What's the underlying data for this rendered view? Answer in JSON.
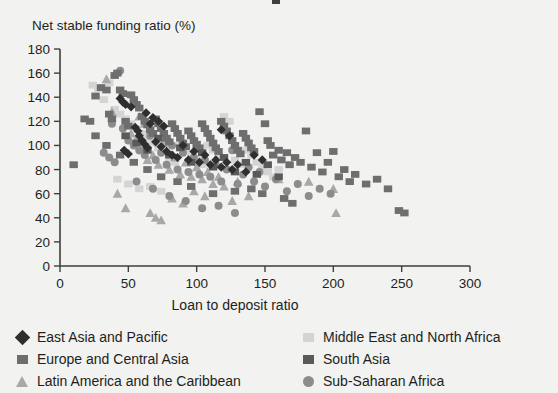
{
  "chart_data": {
    "type": "scatter",
    "title": "",
    "xlabel": "Loan to deposit ratio",
    "ylabel": "Net stable funding ratio (%)",
    "xlim": [
      0,
      300
    ],
    "ylim": [
      0,
      180
    ],
    "xticks": [
      0,
      50,
      100,
      150,
      200,
      250,
      300
    ],
    "yticks": [
      0,
      20,
      40,
      60,
      80,
      100,
      120,
      140,
      160,
      180
    ],
    "grid": false,
    "legend_position": "below-plot-two-columns",
    "series": [
      {
        "name": "East Asia and Pacific",
        "marker": "diamond",
        "color": "#2f2f2f",
        "points": [
          [
            44,
            139
          ],
          [
            46,
            136
          ],
          [
            48,
            134
          ],
          [
            52,
            132
          ],
          [
            55,
            115
          ],
          [
            57,
            112
          ],
          [
            58,
            108
          ],
          [
            60,
            104
          ],
          [
            62,
            101
          ],
          [
            64,
            98
          ],
          [
            47,
            96
          ],
          [
            50,
            93
          ],
          [
            66,
            118
          ],
          [
            70,
            103
          ],
          [
            74,
            99
          ],
          [
            78,
            95
          ],
          [
            82,
            92
          ],
          [
            86,
            90
          ],
          [
            90,
            100
          ],
          [
            94,
            88
          ],
          [
            98,
            95
          ],
          [
            102,
            86
          ],
          [
            106,
            92
          ],
          [
            110,
            84
          ],
          [
            114,
            88
          ],
          [
            118,
            82
          ],
          [
            122,
            86
          ],
          [
            126,
            80
          ],
          [
            130,
            84
          ],
          [
            136,
            78
          ],
          [
            142,
            92
          ],
          [
            148,
            88
          ],
          [
            118,
            113
          ],
          [
            124,
            108
          ],
          [
            63,
            127
          ],
          [
            68,
            123
          ],
          [
            72,
            120
          ],
          [
            76,
            116
          ]
        ]
      },
      {
        "name": "Europe and Central Asia",
        "marker": "square",
        "color": "#6e6e6e",
        "points": [
          [
            10,
            84
          ],
          [
            18,
            122
          ],
          [
            22,
            120
          ],
          [
            26,
            141
          ],
          [
            30,
            148
          ],
          [
            34,
            146
          ],
          [
            36,
            126
          ],
          [
            38,
            122
          ],
          [
            40,
            158
          ],
          [
            42,
            160
          ],
          [
            44,
            146
          ],
          [
            46,
            143
          ],
          [
            48,
            120
          ],
          [
            50,
            116
          ],
          [
            52,
            142
          ],
          [
            54,
            138
          ],
          [
            56,
            134
          ],
          [
            58,
            131
          ],
          [
            60,
            124
          ],
          [
            62,
            120
          ],
          [
            64,
            117
          ],
          [
            66,
            113
          ],
          [
            68,
            110
          ],
          [
            70,
            122
          ],
          [
            72,
            118
          ],
          [
            74,
            114
          ],
          [
            76,
            110
          ],
          [
            78,
            106
          ],
          [
            80,
            103
          ],
          [
            82,
            118
          ],
          [
            84,
            114
          ],
          [
            86,
            110
          ],
          [
            88,
            106
          ],
          [
            90,
            102
          ],
          [
            92,
            99
          ],
          [
            94,
            112
          ],
          [
            96,
            108
          ],
          [
            98,
            104
          ],
          [
            100,
            101
          ],
          [
            102,
            98
          ],
          [
            104,
            118
          ],
          [
            106,
            114
          ],
          [
            108,
            110
          ],
          [
            110,
            106
          ],
          [
            112,
            102
          ],
          [
            114,
            98
          ],
          [
            116,
            95
          ],
          [
            118,
            120
          ],
          [
            120,
            116
          ],
          [
            122,
            112
          ],
          [
            124,
            108
          ],
          [
            126,
            104
          ],
          [
            128,
            100
          ],
          [
            130,
            96
          ],
          [
            132,
            93
          ],
          [
            134,
            110
          ],
          [
            136,
            106
          ],
          [
            138,
            102
          ],
          [
            140,
            98
          ],
          [
            142,
            95
          ],
          [
            146,
            128
          ],
          [
            150,
            118
          ],
          [
            152,
            104
          ],
          [
            154,
            100
          ],
          [
            156,
            92
          ],
          [
            160,
            96
          ],
          [
            162,
            88
          ],
          [
            166,
            94
          ],
          [
            168,
            84
          ],
          [
            172,
            90
          ],
          [
            176,
            86
          ],
          [
            180,
            112
          ],
          [
            184,
            82
          ],
          [
            188,
            94
          ],
          [
            192,
            78
          ],
          [
            196,
            86
          ],
          [
            200,
            95
          ],
          [
            204,
            74
          ],
          [
            208,
            80
          ],
          [
            212,
            70
          ],
          [
            216,
            76
          ],
          [
            224,
            68
          ],
          [
            232,
            72
          ],
          [
            240,
            64
          ],
          [
            248,
            46
          ],
          [
            252,
            44
          ],
          [
            164,
            56
          ],
          [
            170,
            52
          ],
          [
            140,
            64
          ],
          [
            148,
            60
          ],
          [
            128,
            62
          ],
          [
            112,
            60
          ],
          [
            96,
            66
          ],
          [
            86,
            70
          ],
          [
            74,
            74
          ],
          [
            64,
            80
          ],
          [
            54,
            86
          ],
          [
            44,
            92
          ],
          [
            34,
            100
          ],
          [
            26,
            108
          ]
        ]
      },
      {
        "name": "Latin America and the Caribbean",
        "marker": "triangle",
        "color": "#a8a8a8",
        "points": [
          [
            34,
            155
          ],
          [
            38,
            128
          ],
          [
            42,
            60
          ],
          [
            48,
            48
          ],
          [
            52,
            110
          ],
          [
            56,
            106
          ],
          [
            60,
            96
          ],
          [
            64,
            88
          ],
          [
            68,
            92
          ],
          [
            72,
            84
          ],
          [
            76,
            102
          ],
          [
            80,
            80
          ],
          [
            84,
            90
          ],
          [
            88,
            76
          ],
          [
            92,
            86
          ],
          [
            96,
            74
          ],
          [
            100,
            82
          ],
          [
            104,
            72
          ],
          [
            108,
            78
          ],
          [
            112,
            68
          ],
          [
            116,
            74
          ],
          [
            120,
            66
          ],
          [
            66,
            44
          ],
          [
            70,
            40
          ],
          [
            74,
            38
          ],
          [
            82,
            56
          ],
          [
            90,
            52
          ],
          [
            98,
            62
          ],
          [
            130,
            70
          ],
          [
            138,
            58
          ],
          [
            160,
            72
          ],
          [
            182,
            70
          ],
          [
            200,
            64
          ],
          [
            202,
            44
          ],
          [
            126,
            54
          ],
          [
            106,
            58
          ],
          [
            58,
            124
          ],
          [
            62,
            118
          ]
        ]
      },
      {
        "name": "Middle East and North Africa",
        "marker": "square",
        "color": "#d4d4d4",
        "points": [
          [
            24,
            150
          ],
          [
            28,
            147
          ],
          [
            32,
            138
          ],
          [
            36,
            152
          ],
          [
            40,
            130
          ],
          [
            44,
            126
          ],
          [
            48,
            122
          ],
          [
            52,
            118
          ],
          [
            56,
            114
          ],
          [
            60,
            110
          ],
          [
            64,
            106
          ],
          [
            68,
            102
          ],
          [
            72,
            98
          ],
          [
            76,
            94
          ],
          [
            80,
            90
          ],
          [
            84,
            86
          ],
          [
            88,
            100
          ],
          [
            92,
            96
          ],
          [
            96,
            92
          ],
          [
            100,
            88
          ],
          [
            104,
            84
          ],
          [
            108,
            100
          ],
          [
            112,
            96
          ],
          [
            116,
            92
          ],
          [
            120,
            124
          ],
          [
            124,
            120
          ],
          [
            128,
            88
          ],
          [
            132,
            84
          ],
          [
            136,
            96
          ],
          [
            140,
            92
          ],
          [
            144,
            86
          ],
          [
            148,
            82
          ],
          [
            152,
            78
          ],
          [
            156,
            74
          ],
          [
            160,
            80
          ],
          [
            42,
            72
          ],
          [
            50,
            68
          ],
          [
            58,
            64
          ],
          [
            66,
            66
          ],
          [
            74,
            62
          ]
        ]
      },
      {
        "name": "South Asia",
        "marker": "square",
        "color": "#5a5a5a",
        "points": [
          [
            48,
            108
          ],
          [
            56,
            102
          ],
          [
            64,
            96
          ],
          [
            72,
            106
          ],
          [
            80,
            92
          ],
          [
            88,
            98
          ],
          [
            96,
            86
          ],
          [
            104,
            94
          ],
          [
            112,
            82
          ],
          [
            120,
            90
          ],
          [
            128,
            78
          ],
          [
            136,
            86
          ],
          [
            144,
            76
          ],
          [
            152,
            84
          ],
          [
            160,
            74
          ]
        ]
      },
      {
        "name": "Sub-Saharan Africa",
        "marker": "circle",
        "color": "#8c8c8c",
        "points": [
          [
            44,
            162
          ],
          [
            38,
            118
          ],
          [
            46,
            114
          ],
          [
            50,
            104
          ],
          [
            54,
            100
          ],
          [
            58,
            96
          ],
          [
            62,
            92
          ],
          [
            66,
            108
          ],
          [
            70,
            88
          ],
          [
            74,
            94
          ],
          [
            78,
            84
          ],
          [
            82,
            100
          ],
          [
            86,
            80
          ],
          [
            90,
            94
          ],
          [
            94,
            78
          ],
          [
            98,
            90
          ],
          [
            102,
            76
          ],
          [
            106,
            88
          ],
          [
            110,
            74
          ],
          [
            114,
            84
          ],
          [
            118,
            70
          ],
          [
            122,
            80
          ],
          [
            126,
            96
          ],
          [
            130,
            68
          ],
          [
            134,
            76
          ],
          [
            138,
            82
          ],
          [
            142,
            70
          ],
          [
            146,
            78
          ],
          [
            150,
            66
          ],
          [
            158,
            72
          ],
          [
            166,
            62
          ],
          [
            174,
            68
          ],
          [
            182,
            58
          ],
          [
            190,
            64
          ],
          [
            198,
            60
          ],
          [
            40,
            86
          ],
          [
            36,
            90
          ],
          [
            32,
            94
          ],
          [
            56,
            70
          ],
          [
            68,
            64
          ],
          [
            80,
            58
          ],
          [
            92,
            54
          ],
          [
            104,
            48
          ],
          [
            116,
            50
          ],
          [
            128,
            44
          ]
        ]
      }
    ]
  },
  "axes": {
    "y_title": "Net stable funding ratio (%)",
    "x_title": "Loan to deposit ratio"
  },
  "legend": {
    "left_items": [
      {
        "label": "East Asia and Pacific",
        "marker": "diamond",
        "color": "#2f2f2f"
      },
      {
        "label": "Europe and Central Asia",
        "marker": "square",
        "color": "#6e6e6e"
      },
      {
        "label": "Latin America and the Caribbean",
        "marker": "triangle",
        "color": "#a8a8a8"
      }
    ],
    "right_items": [
      {
        "label": "Middle East and North Africa",
        "marker": "square",
        "color": "#d4d4d4"
      },
      {
        "label": "South Asia",
        "marker": "square",
        "color": "#5a5a5a"
      },
      {
        "label": "Sub-Saharan Africa",
        "marker": "circle",
        "color": "#8c8c8c"
      }
    ]
  },
  "colors": {
    "background": "#f2f2f0",
    "axis": "#3f3f3f",
    "text": "#231f20"
  }
}
